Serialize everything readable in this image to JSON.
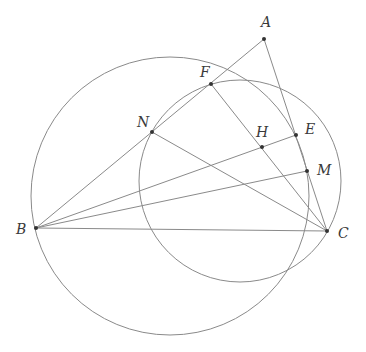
{
  "diagram": {
    "type": "geometry",
    "stroke_color": "#8a8a8a",
    "point_color": "#333333",
    "points": [
      {
        "name": "A",
        "x": 264,
        "y": 39,
        "lx": 261,
        "ly": 27
      },
      {
        "name": "F",
        "x": 211,
        "y": 84,
        "lx": 200,
        "ly": 77
      },
      {
        "name": "N",
        "x": 152,
        "y": 132,
        "lx": 137,
        "ly": 127
      },
      {
        "name": "H",
        "x": 262,
        "y": 147,
        "lx": 256,
        "ly": 137
      },
      {
        "name": "E",
        "x": 296,
        "y": 135,
        "lx": 305,
        "ly": 134
      },
      {
        "name": "M",
        "x": 307,
        "y": 171,
        "lx": 317,
        "ly": 175
      },
      {
        "name": "B",
        "x": 36,
        "y": 228,
        "lx": 16,
        "ly": 234
      },
      {
        "name": "C",
        "x": 327,
        "y": 231,
        "lx": 338,
        "ly": 238
      }
    ],
    "segments": [
      [
        "B",
        "A"
      ],
      [
        "A",
        "C"
      ],
      [
        "B",
        "C"
      ],
      [
        "B",
        "E"
      ],
      [
        "B",
        "M"
      ],
      [
        "F",
        "C"
      ],
      [
        "N",
        "C"
      ]
    ],
    "circles": [
      {
        "name": "circle-BNEM",
        "cx": 170,
        "cy": 196,
        "r": 139
      },
      {
        "name": "circle-FNC",
        "cx": 240,
        "cy": 181,
        "r": 101
      }
    ]
  }
}
